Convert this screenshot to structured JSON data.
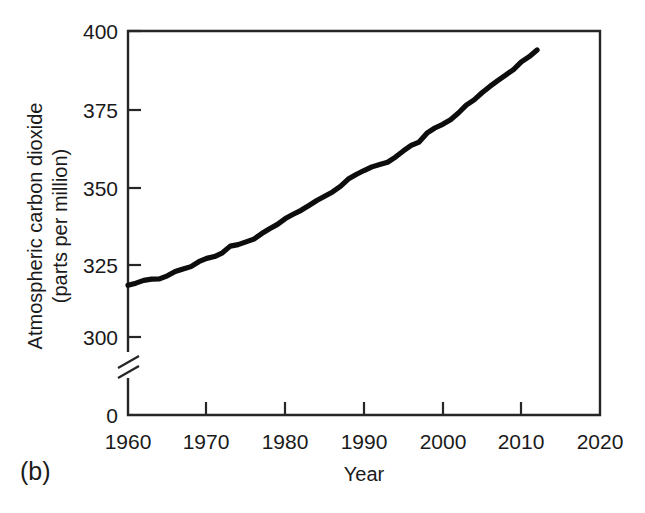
{
  "figure": {
    "panel_label": "(b)",
    "background_color": "#ffffff",
    "line_color": "#0d0d0d",
    "axis_color": "#262626"
  },
  "chart_data": {
    "type": "line",
    "title": "",
    "xlabel": "Year",
    "ylabel": "Atmospheric carbon dioxide (parts per million)",
    "ylabel_line1": "Atmospheric carbon dioxide",
    "ylabel_line2": "(parts per million)",
    "xlim": [
      1960,
      2020
    ],
    "ylim": [
      300,
      400
    ],
    "y_axis_break": true,
    "y_axis_break_note": "axis broken between 0 and 300",
    "y_zero_tick_label": "0",
    "grid": false,
    "legend": false,
    "xticks": [
      1960,
      1970,
      1980,
      1990,
      2000,
      2010,
      2020
    ],
    "xtick_labels": [
      "1960",
      "1970",
      "1980",
      "1990",
      "2000",
      "2010",
      "2020"
    ],
    "yticks": [
      300,
      325,
      350,
      375,
      400
    ],
    "ytick_labels": [
      "300",
      "325",
      "350",
      "375",
      "400"
    ],
    "series": [
      {
        "name": "Atmospheric CO2",
        "x": [
          1960,
          1961,
          1962,
          1963,
          1964,
          1965,
          1966,
          1967,
          1968,
          1969,
          1970,
          1971,
          1972,
          1973,
          1974,
          1975,
          1976,
          1977,
          1978,
          1979,
          1980,
          1981,
          1982,
          1983,
          1984,
          1985,
          1986,
          1987,
          1988,
          1989,
          1990,
          1991,
          1992,
          1993,
          1994,
          1995,
          1996,
          1997,
          1998,
          1999,
          2000,
          2001,
          2002,
          2003,
          2004,
          2005,
          2006,
          2007,
          2008,
          2009,
          2010,
          2011,
          2012
        ],
        "values": [
          316.9,
          317.6,
          318.5,
          318.9,
          319.0,
          320.0,
          321.4,
          322.2,
          323.0,
          324.6,
          325.7,
          326.3,
          327.5,
          329.7,
          330.2,
          331.1,
          332.0,
          333.8,
          335.4,
          336.8,
          338.7,
          340.1,
          341.4,
          343.0,
          344.6,
          346.0,
          347.4,
          349.2,
          351.6,
          353.1,
          354.4,
          355.6,
          356.4,
          357.1,
          358.8,
          360.8,
          362.6,
          363.7,
          366.6,
          368.3,
          369.5,
          371.0,
          373.2,
          375.8,
          377.5,
          379.8,
          381.9,
          383.8,
          385.6,
          387.4,
          389.9,
          391.6,
          393.8
        ]
      }
    ]
  }
}
